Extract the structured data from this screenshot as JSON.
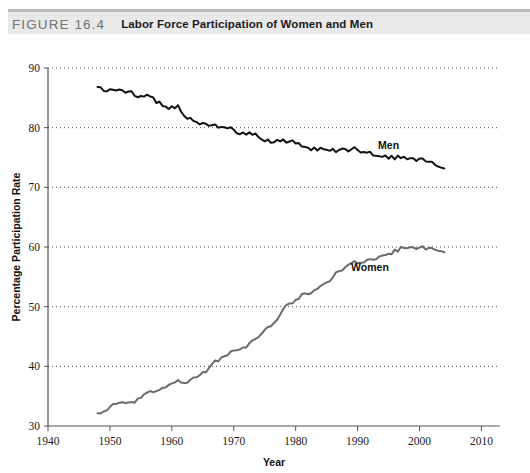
{
  "header": {
    "figure_number": "FIGURE 16.4",
    "title": "Labor Force Participation of Women and Men",
    "band_color": "#e9e9ea",
    "rule_color": "#b9bcc0"
  },
  "chart_data": {
    "type": "line",
    "title": "Labor Force Participation of Women and Men",
    "xlabel": "Year",
    "ylabel": "Percentage Participation Rate",
    "xlim": [
      1940,
      2013
    ],
    "ylim": [
      30,
      90
    ],
    "xticks": [
      1940,
      1950,
      1960,
      1970,
      1980,
      1990,
      2000,
      2010
    ],
    "yticks": [
      30,
      40,
      50,
      60,
      70,
      80,
      90
    ],
    "grid": "horizontal-dotted",
    "legend": "inline-annotations",
    "annotations": [
      {
        "text": "Men",
        "x": 1995,
        "y": 76.5,
        "color": "#111111"
      },
      {
        "text": "Women",
        "x": 1992,
        "y": 56.0,
        "color": "#111111"
      }
    ],
    "series": [
      {
        "name": "Men",
        "color": "#111111",
        "line_width": 2.0,
        "x": [
          1948,
          1949,
          1950,
          1951,
          1952,
          1953,
          1954,
          1955,
          1956,
          1957,
          1958,
          1959,
          1960,
          1961,
          1962,
          1963,
          1964,
          1965,
          1966,
          1967,
          1968,
          1969,
          1970,
          1971,
          1972,
          1973,
          1974,
          1975,
          1976,
          1977,
          1978,
          1979,
          1980,
          1981,
          1982,
          1983,
          1984,
          1985,
          1986,
          1987,
          1988,
          1989,
          1990,
          1991,
          1992,
          1993,
          1994,
          1995,
          1996,
          1997,
          1998,
          1999,
          2000,
          2001,
          2002,
          2003,
          2004
        ],
        "values": [
          86.6,
          86.4,
          86.4,
          86.3,
          86.3,
          86.0,
          85.5,
          85.4,
          85.5,
          84.8,
          84.2,
          83.7,
          83.3,
          83.6,
          82.0,
          81.4,
          81.0,
          80.7,
          80.4,
          80.4,
          80.1,
          79.8,
          79.7,
          79.1,
          78.9,
          78.8,
          78.7,
          77.9,
          77.5,
          77.7,
          77.9,
          77.8,
          77.4,
          77.0,
          76.6,
          76.4,
          76.4,
          76.3,
          76.3,
          76.2,
          76.2,
          76.4,
          76.4,
          75.8,
          75.8,
          75.4,
          75.1,
          75.0,
          74.9,
          75.0,
          74.9,
          74.7,
          74.8,
          74.4,
          74.1,
          73.5,
          73.3
        ]
      },
      {
        "name": "Women",
        "color": "#6b6b6b",
        "line_width": 2.0,
        "x": [
          1948,
          1949,
          1950,
          1951,
          1952,
          1953,
          1954,
          1955,
          1956,
          1957,
          1958,
          1959,
          1960,
          1961,
          1962,
          1963,
          1964,
          1965,
          1966,
          1967,
          1968,
          1969,
          1970,
          1971,
          1972,
          1973,
          1974,
          1975,
          1976,
          1977,
          1978,
          1979,
          1980,
          1981,
          1982,
          1983,
          1984,
          1985,
          1986,
          1987,
          1988,
          1989,
          1990,
          1991,
          1992,
          1993,
          1994,
          1995,
          1996,
          1997,
          1998,
          1999,
          2000,
          2001,
          2002,
          2003,
          2004
        ],
        "values": [
          32.0,
          32.4,
          33.2,
          33.8,
          33.8,
          33.8,
          33.9,
          34.7,
          35.6,
          35.9,
          36.0,
          36.4,
          37.2,
          37.5,
          37.3,
          37.8,
          38.3,
          38.8,
          39.6,
          40.8,
          41.3,
          42.1,
          42.6,
          42.6,
          43.3,
          44.2,
          45.1,
          45.9,
          46.9,
          47.9,
          49.6,
          50.6,
          51.2,
          52.1,
          52.3,
          52.7,
          53.2,
          54.2,
          55.0,
          55.8,
          56.4,
          57.2,
          57.5,
          57.4,
          57.8,
          57.8,
          58.8,
          58.9,
          59.3,
          59.8,
          59.8,
          60.0,
          59.9,
          59.8,
          59.6,
          59.5,
          59.2
        ]
      }
    ]
  },
  "axis": {
    "y_title": "Percentage Participation Rate",
    "x_title": "Year"
  }
}
